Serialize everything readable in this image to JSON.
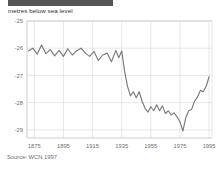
{
  "header": {
    "title_bar_redacted": true,
    "title_bar_color": "#565656",
    "subtitle": "metres below sea level"
  },
  "footer": {
    "source": "Source: WCN 1997"
  },
  "colors": {
    "line": "#7a7a7a",
    "grid": "#d8d8d8",
    "axis": "#b9b9b9",
    "tick_text": "#6f6f6f",
    "subtitle_text": "#2b2b2b",
    "source_text": "#6d6d6d",
    "background": "#ffffff"
  },
  "chart_data": {
    "type": "line",
    "title": "",
    "subtitle": "metres below sea level",
    "xlabel": "",
    "ylabel": "metres below sea level",
    "xlim": [
      1870,
      1997
    ],
    "ylim": [
      -29.3,
      -25.0
    ],
    "yticks": [
      -25,
      -26,
      -27,
      -28,
      -29
    ],
    "ytick_labels": [
      "-25",
      "-26",
      "-27",
      "-28",
      "-29"
    ],
    "xticks": [
      1875,
      1895,
      1915,
      1935,
      1955,
      1975,
      1995
    ],
    "xtick_labels": [
      "1875",
      "1895",
      "1915",
      "1935",
      "1955",
      "1975",
      "1995"
    ],
    "grid": true,
    "grid_axes": "both",
    "legend": false,
    "source": "Source: WCN 1997",
    "series": [
      {
        "name": "Dead Sea water level",
        "color": "#7a7a7a",
        "x": [
          1871,
          1874,
          1877,
          1880,
          1883,
          1886,
          1889,
          1892,
          1895,
          1898,
          1901,
          1904,
          1907,
          1910,
          1913,
          1916,
          1919,
          1922,
          1925,
          1928,
          1931,
          1933,
          1935,
          1937,
          1939,
          1941,
          1943,
          1945,
          1947,
          1949,
          1951,
          1953,
          1955,
          1957,
          1959,
          1961,
          1963,
          1965,
          1967,
          1969,
          1971,
          1973,
          1975,
          1977,
          1979,
          1981,
          1983,
          1985,
          1987,
          1989,
          1991,
          1993,
          1995
        ],
        "y": [
          -26.1,
          -26.0,
          -26.22,
          -25.88,
          -26.2,
          -26.05,
          -26.28,
          -26.08,
          -26.3,
          -26.02,
          -26.25,
          -26.1,
          -26.0,
          -26.18,
          -26.3,
          -26.12,
          -26.45,
          -26.25,
          -26.18,
          -26.5,
          -26.08,
          -26.35,
          -26.1,
          -26.85,
          -27.4,
          -27.75,
          -27.6,
          -27.82,
          -27.6,
          -27.95,
          -28.2,
          -28.35,
          -28.15,
          -28.3,
          -28.08,
          -28.3,
          -28.12,
          -28.4,
          -28.3,
          -28.45,
          -28.38,
          -28.52,
          -28.7,
          -29.05,
          -28.55,
          -28.3,
          -28.25,
          -27.95,
          -27.8,
          -27.55,
          -27.6,
          -27.4,
          -27.05
        ]
      }
    ]
  }
}
